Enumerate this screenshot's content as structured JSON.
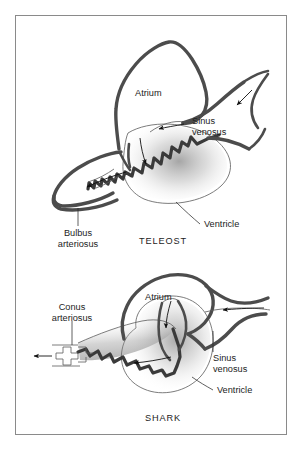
{
  "figure": {
    "background_color": "#ffffff",
    "frame_color": "#8a8a8a",
    "ink_color": "#4c4c4c",
    "text_color": "#1d1d1d"
  },
  "panels": [
    {
      "id": "teleost",
      "caption": "TELEOST",
      "labels": {
        "atrium": "Atrium",
        "sinus_venosus_line1": "Sinus",
        "sinus_venosus_line2": "venosus",
        "ventricle": "Ventricle",
        "outflow_line1": "Bulbus",
        "outflow_line2": "arteriosus"
      }
    },
    {
      "id": "shark",
      "caption": "SHARK",
      "labels": {
        "atrium": "Atrium",
        "sinus_venosus_line1": "Sinus",
        "sinus_venosus_line2": "venosus",
        "ventricle": "Ventricle",
        "outflow_line1": "Conus",
        "outflow_line2": "arteriosus"
      }
    }
  ]
}
